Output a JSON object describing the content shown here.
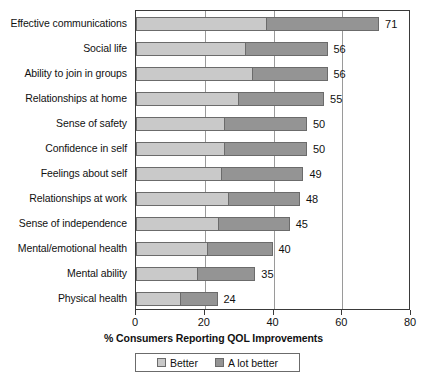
{
  "chart_data": {
    "type": "bar",
    "orientation": "horizontal",
    "stacked": true,
    "title": "",
    "xlabel": "% Consumers Reporting QOL Improvements",
    "ylabel": "",
    "xlim": [
      0,
      80
    ],
    "xticks": [
      0,
      20,
      40,
      60,
      80
    ],
    "xtick_labels": [
      "0",
      "20",
      "40",
      "60",
      "80"
    ],
    "grid": "vertical",
    "legend_position": "bottom-center",
    "categories": [
      "Effective communications",
      "Social life",
      "Ability to join in groups",
      "Relationships at home",
      "Sense of safety",
      "Confidence in self",
      "Feelings about self",
      "Relationships at work",
      "Sense of independence",
      "Mental/emotional health",
      "Mental ability",
      "Physical health"
    ],
    "series": [
      {
        "name": "Better",
        "color": "#c9c9c9",
        "values": [
          38,
          32,
          34,
          30,
          26,
          26,
          25,
          27,
          24,
          21,
          18,
          13
        ]
      },
      {
        "name": "A lot better",
        "color": "#949494",
        "values": [
          33,
          24,
          22,
          25,
          24,
          24,
          24,
          21,
          21,
          19,
          17,
          11
        ]
      }
    ],
    "totals": [
      71,
      56,
      56,
      55,
      50,
      50,
      49,
      48,
      45,
      40,
      35,
      24
    ],
    "total_labels": [
      "71",
      "56",
      "56",
      "55",
      "50",
      "50",
      "49",
      "48",
      "45",
      "40",
      "35",
      "24"
    ]
  },
  "legend": {
    "items": [
      {
        "label": "Better",
        "color": "#c9c9c9"
      },
      {
        "label": "A lot better",
        "color": "#949494"
      }
    ]
  },
  "axis": {
    "x_title": "% Consumers Reporting QOL Improvements"
  }
}
